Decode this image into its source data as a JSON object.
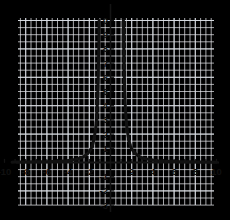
{
  "chart_data": {
    "type": "line",
    "title": "",
    "subtitle": "",
    "xlabel": "",
    "ylabel": "",
    "xlim": [
      -10,
      10
    ],
    "ylim": [
      -3,
      10
    ],
    "grid": true,
    "legend": null,
    "legend_position": "none",
    "background_color": "#ffffff",
    "grid_color": "#d8dce3",
    "minor_grid_color": "#eceef2",
    "axis_color": "#141414",
    "curve_color": "#111111",
    "curve_width": 3,
    "x_tick_labels": [
      "-10",
      "-8",
      "-6",
      "-4",
      "-2",
      "2",
      "4",
      "6",
      "8",
      "10"
    ],
    "x_tick_values": [
      -10,
      -8,
      -6,
      -4,
      -2,
      2,
      4,
      6,
      8,
      10
    ],
    "x_tick_step_minor": 1,
    "y_tick_labels": [
      "0",
      "9",
      "8",
      "7",
      "6",
      "5",
      "4",
      "3",
      "2",
      "1",
      "-1",
      "-2",
      "-3"
    ],
    "y_tick_values": [
      10,
      9,
      8,
      7,
      6,
      5,
      4,
      3,
      2,
      1,
      -1,
      -2,
      -3
    ],
    "asymptotes": {
      "vertical": [
        -1.05,
        1.2
      ],
      "horizontal": [
        0
      ]
    },
    "series": [
      {
        "name": "left-branch",
        "description": "Decaying branch approaching y=0 as x decreases, rising steeply to y=10 at the left vertical asymptote near x=-1",
        "points": [
          [
            -10.0,
            0.02
          ],
          [
            -9.0,
            0.03
          ],
          [
            -8.0,
            0.04
          ],
          [
            -7.0,
            0.05
          ],
          [
            -6.0,
            0.06
          ],
          [
            -5.2,
            0.08
          ],
          [
            -4.6,
            0.1
          ],
          [
            -4.1,
            0.13
          ],
          [
            -3.7,
            0.17
          ],
          [
            -3.3,
            0.22
          ],
          [
            -3.0,
            0.28
          ],
          [
            -2.7,
            0.35
          ],
          [
            -2.45,
            0.45
          ],
          [
            -2.2,
            0.6
          ],
          [
            -2.0,
            0.75
          ],
          [
            -1.85,
            0.95
          ],
          [
            -1.7,
            1.2
          ],
          [
            -1.6,
            1.5
          ],
          [
            -1.5,
            1.9
          ],
          [
            -1.42,
            2.3
          ],
          [
            -1.35,
            2.8
          ],
          [
            -1.3,
            3.3
          ],
          [
            -1.25,
            4.0
          ],
          [
            -1.21,
            4.7
          ],
          [
            -1.18,
            5.4
          ],
          [
            -1.15,
            6.2
          ],
          [
            -1.13,
            7.0
          ],
          [
            -1.11,
            7.8
          ],
          [
            -1.09,
            8.6
          ],
          [
            -1.08,
            9.3
          ],
          [
            -1.07,
            10.0
          ]
        ]
      },
      {
        "name": "right-branch",
        "description": "Steep branch falling from y=10 at the right vertical asymptote near x=1.2 and decaying to y=0 as x increases",
        "points": [
          [
            1.22,
            10.0
          ],
          [
            1.23,
            9.3
          ],
          [
            1.24,
            8.6
          ],
          [
            1.26,
            7.8
          ],
          [
            1.28,
            7.0
          ],
          [
            1.3,
            6.2
          ],
          [
            1.33,
            5.4
          ],
          [
            1.36,
            4.7
          ],
          [
            1.4,
            4.0
          ],
          [
            1.45,
            3.3
          ],
          [
            1.5,
            2.8
          ],
          [
            1.57,
            2.3
          ],
          [
            1.65,
            1.9
          ],
          [
            1.75,
            1.5
          ],
          [
            1.88,
            1.2
          ],
          [
            2.0,
            0.95
          ],
          [
            2.2,
            0.75
          ],
          [
            2.4,
            0.6
          ],
          [
            2.65,
            0.45
          ],
          [
            2.9,
            0.35
          ],
          [
            3.2,
            0.28
          ],
          [
            3.6,
            0.22
          ],
          [
            4.0,
            0.17
          ],
          [
            4.5,
            0.13
          ],
          [
            5.1,
            0.1
          ],
          [
            5.8,
            0.08
          ],
          [
            6.6,
            0.06
          ],
          [
            7.5,
            0.05
          ],
          [
            8.4,
            0.04
          ],
          [
            9.2,
            0.03
          ],
          [
            10.0,
            0.02
          ]
        ]
      }
    ]
  }
}
